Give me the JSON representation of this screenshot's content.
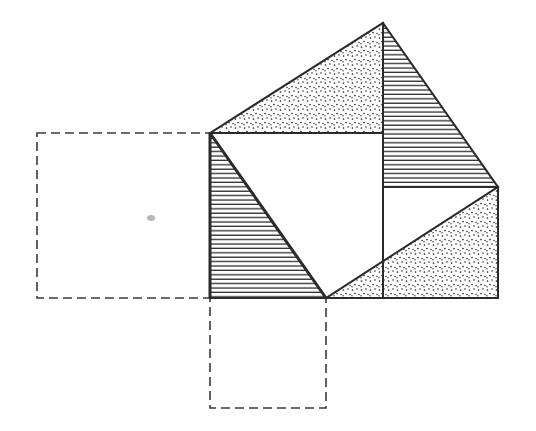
{
  "diagram": {
    "title": "",
    "colors": {
      "line": "#2a2a2a",
      "dashed": "#3a3a3a",
      "background": "#ffffff",
      "smudge": "#9a9a9a"
    },
    "regions": [
      {
        "id": "top-left-triangle",
        "fill": "dotted"
      },
      {
        "id": "top-right-triangle",
        "fill": "hatched"
      },
      {
        "id": "left-triangle",
        "fill": "hatched"
      },
      {
        "id": "bottom-right-triangle",
        "fill": "dotted"
      },
      {
        "id": "central-square",
        "fill": "none"
      }
    ],
    "construction_squares": [
      {
        "id": "left-leg-square",
        "style": "dashed"
      },
      {
        "id": "bottom-leg-square",
        "style": "dashed"
      }
    ],
    "labels": []
  }
}
